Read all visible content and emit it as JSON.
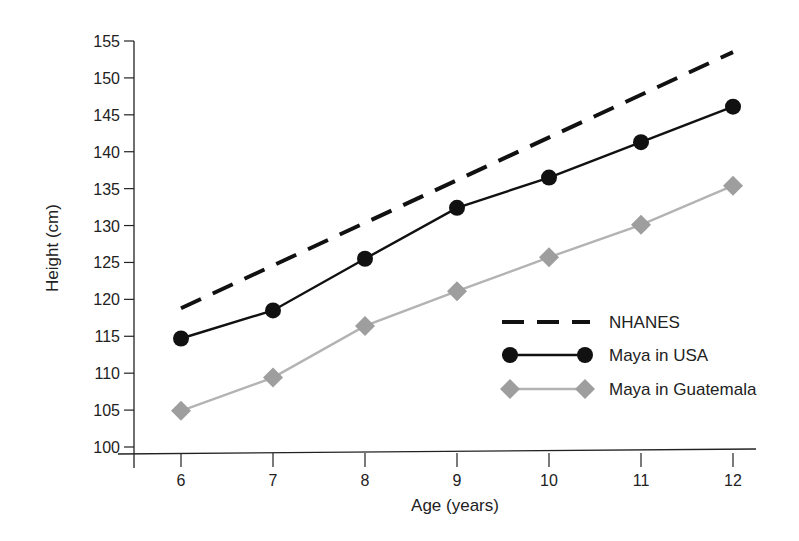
{
  "chart_data": {
    "type": "line",
    "title": "",
    "xlabel": "Age (years)",
    "ylabel": "Height (cm)",
    "x": [
      6,
      7,
      8,
      9,
      10,
      11,
      12
    ],
    "xlim": [
      5.5,
      12.3
    ],
    "ylim": [
      100,
      155
    ],
    "yticks": [
      100,
      105,
      110,
      115,
      120,
      125,
      130,
      135,
      140,
      145,
      150,
      155
    ],
    "xticks": [
      6,
      7,
      8,
      9,
      10,
      11,
      12
    ],
    "grid": false,
    "legend_position": "lower right",
    "series": [
      {
        "name": "NHANES",
        "style": "dashed",
        "color": "#111111",
        "marker": "none",
        "values": [
          118.8,
          null,
          null,
          null,
          null,
          null,
          153.5
        ]
      },
      {
        "name": "Maya in USA",
        "style": "solid",
        "color": "#111111",
        "marker": "circle",
        "values": [
          114.7,
          118.5,
          125.5,
          132.4,
          136.5,
          141.3,
          146.1
        ]
      },
      {
        "name": "Maya in Guatemala",
        "style": "solid",
        "color": "#a0a0a0",
        "marker": "diamond",
        "values": [
          104.9,
          109.4,
          116.4,
          121.1,
          125.7,
          130.1,
          135.4
        ]
      }
    ]
  },
  "legend": {
    "items": [
      {
        "label": "NHANES"
      },
      {
        "label": "Maya in USA"
      },
      {
        "label": "Maya in Guatemala"
      }
    ]
  },
  "axes": {
    "xlabel": "Age (years)",
    "ylabel": "Height (cm)"
  }
}
